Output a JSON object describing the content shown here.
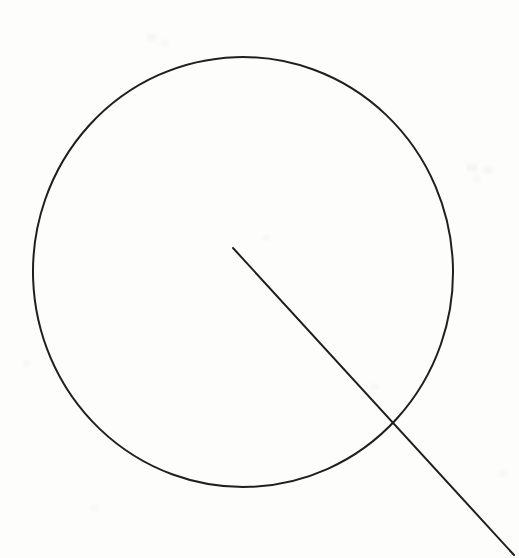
{
  "document": {
    "title": "Circle with radius line drawing",
    "kind": "line-drawing",
    "description": "A large hand-drawn circle with a straight line starting near the circle's centre and extending down to the right, crossing the circle's lower-right arc and continuing off the bottom-right corner of the page.",
    "width": 519,
    "height": 558
  },
  "canvas": {
    "background_color": "#fdfdfc",
    "ink_color": "#1f1f1f",
    "smudge_color": "#efeeec"
  },
  "figure": {
    "circle": {
      "label": "circle",
      "center_x": 243,
      "center_y": 272,
      "radius_x": 210,
      "radius_y": 215,
      "stroke_width": 2.0,
      "stroke_color": "#1f1f1f",
      "fill": "none",
      "bounds": {
        "left": 33,
        "top": 57,
        "right": 453,
        "bottom": 487
      }
    },
    "radius_line": {
      "label": "radius-line",
      "x1": 233,
      "y1": 248,
      "x2": 514,
      "y2": 555,
      "stroke_width": 2.0,
      "stroke_color": "#1f1f1f",
      "starts_near_center": true,
      "extends_beyond_circle": true
    },
    "intersection_point": {
      "label": "line-circle-intersection",
      "x": 398,
      "y": 420
    }
  },
  "artifacts": {
    "label": "scan-smudges",
    "marks": [
      {
        "x": 466,
        "y": 163,
        "w": 12,
        "h": 9,
        "opacity": 0.55
      },
      {
        "x": 483,
        "y": 166,
        "w": 10,
        "h": 8,
        "opacity": 0.45
      },
      {
        "x": 472,
        "y": 176,
        "w": 9,
        "h": 7,
        "opacity": 0.4
      },
      {
        "x": 146,
        "y": 33,
        "w": 11,
        "h": 8,
        "opacity": 0.45
      },
      {
        "x": 160,
        "y": 40,
        "w": 9,
        "h": 7,
        "opacity": 0.35
      },
      {
        "x": 262,
        "y": 235,
        "w": 8,
        "h": 6,
        "opacity": 0.35
      },
      {
        "x": 370,
        "y": 383,
        "w": 10,
        "h": 7,
        "opacity": 0.3
      },
      {
        "x": 22,
        "y": 360,
        "w": 9,
        "h": 7,
        "opacity": 0.3
      },
      {
        "x": 498,
        "y": 470,
        "w": 10,
        "h": 8,
        "opacity": 0.3
      },
      {
        "x": 90,
        "y": 505,
        "w": 9,
        "h": 7,
        "opacity": 0.3
      }
    ]
  }
}
